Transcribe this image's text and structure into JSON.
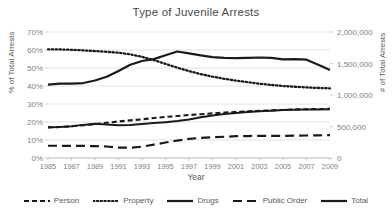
{
  "chart_data": {
    "type": "line",
    "title": "Type of Juvenile Arrests",
    "xlabel": "Year",
    "ylabel": "% of Total Arrests",
    "y2label": "# of Total Arrests",
    "grid": true,
    "legend_position": "bottom",
    "x": [
      1985,
      1986,
      1987,
      1988,
      1989,
      1990,
      1991,
      1992,
      1993,
      1994,
      1995,
      1996,
      1997,
      1998,
      1999,
      2000,
      2001,
      2002,
      2003,
      2004,
      2005,
      2006,
      2007,
      2008,
      2009
    ],
    "xtick_labels": [
      "1985",
      "1987",
      "1989",
      "1991",
      "1993",
      "1995",
      "1997",
      "1999",
      "2001",
      "2003",
      "2005",
      "2007",
      "2009"
    ],
    "xtick_values": [
      1985,
      1987,
      1989,
      1991,
      1993,
      1995,
      1997,
      1999,
      2001,
      2003,
      2005,
      2007,
      2009
    ],
    "xlim": [
      1985,
      2009
    ],
    "ylim": [
      0,
      70
    ],
    "ytick_labels": [
      "0%",
      "10%",
      "20%",
      "30%",
      "40%",
      "50%",
      "60%",
      "70%"
    ],
    "ytick_values": [
      0,
      10,
      20,
      30,
      40,
      50,
      60,
      70
    ],
    "y2lim": [
      0,
      2000000
    ],
    "y2tick_labels": [
      "0",
      "500,000",
      "1,000,000",
      "1,500,000",
      "2,000,000"
    ],
    "y2tick_values": [
      0,
      500000,
      1000000,
      1500000,
      2000000
    ],
    "series": [
      {
        "name": "Person",
        "axis": "left",
        "dash": "5,3",
        "width": 2.1,
        "color": "#1a1a1a",
        "values": [
          17.0,
          17.2,
          17.6,
          18.2,
          18.8,
          19.6,
          20.3,
          20.9,
          21.5,
          22.2,
          22.8,
          23.3,
          23.9,
          24.3,
          24.8,
          25.2,
          25.6,
          25.9,
          26.2,
          26.5,
          26.7,
          27.0,
          27.1,
          27.2,
          27.3
        ]
      },
      {
        "name": "Property",
        "axis": "left",
        "dash": "1.4,2.4",
        "width": 2.3,
        "color": "#1a1a1a",
        "values": [
          60.4,
          60.3,
          60.1,
          59.8,
          59.4,
          59.0,
          58.5,
          57.6,
          56.2,
          54.4,
          52.3,
          50.2,
          48.3,
          46.6,
          45.2,
          44.0,
          43.0,
          42.1,
          41.3,
          40.6,
          40.0,
          39.6,
          39.2,
          38.9,
          38.7
        ]
      },
      {
        "name": "Drugs",
        "axis": "left",
        "dash": "none",
        "width": 2.0,
        "color": "#1a1a1a",
        "values": [
          17.1,
          17.2,
          17.6,
          18.4,
          19.0,
          18.6,
          18.2,
          18.4,
          18.9,
          19.4,
          19.9,
          20.5,
          21.4,
          22.6,
          23.6,
          24.4,
          25.0,
          25.5,
          26.0,
          26.3,
          26.6,
          26.8,
          26.9,
          27.0,
          27.1
        ]
      },
      {
        "name": "Public Order",
        "axis": "left",
        "dash": "9,5",
        "width": 2.2,
        "color": "#1a1a1a",
        "values": [
          6.8,
          6.8,
          6.7,
          6.7,
          6.6,
          6.4,
          5.8,
          5.7,
          6.3,
          7.4,
          8.6,
          9.7,
          10.6,
          11.2,
          11.5,
          11.8,
          12.1,
          12.2,
          12.3,
          12.3,
          12.3,
          12.4,
          12.5,
          12.6,
          12.7
        ]
      },
      {
        "name": "Total",
        "axis": "right",
        "dash": "none",
        "width": 2.2,
        "color": "#1a1a1a",
        "values": [
          1165000,
          1180000,
          1182000,
          1190000,
          1230000,
          1290000,
          1380000,
          1480000,
          1540000,
          1570000,
          1630000,
          1690000,
          1660000,
          1630000,
          1600000,
          1590000,
          1585000,
          1590000,
          1595000,
          1590000,
          1565000,
          1570000,
          1560000,
          1480000,
          1395000
        ]
      }
    ]
  },
  "legend": {
    "items": [
      {
        "label": "Person",
        "style": "dashed"
      },
      {
        "label": "Property",
        "style": "dotted"
      },
      {
        "label": "Drugs",
        "style": "solid"
      },
      {
        "label": "Public Order",
        "style": "long-dashed"
      },
      {
        "label": "Total",
        "style": "solid"
      }
    ]
  }
}
